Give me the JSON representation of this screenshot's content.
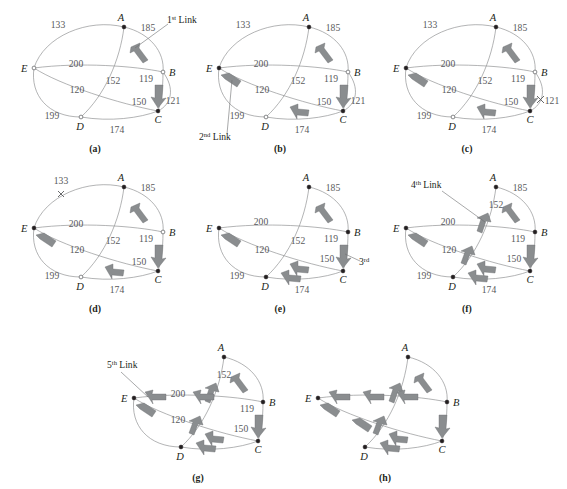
{
  "figure": {
    "nodes": [
      "A",
      "B",
      "C",
      "D",
      "E"
    ],
    "edge_weights": {
      "A_E": 133,
      "A_B": 185,
      "E_B": 200,
      "A_C": 152,
      "B_C": 119,
      "E_C": 120,
      "B_C_outer": 121,
      "D_C_inner": 150,
      "E_D": 199,
      "D_C": 174
    },
    "colors": {
      "edge": "#8a8b8d",
      "arrow_fill": "#8a8d8f",
      "arrow_stroke": "#6b6d70",
      "number": "#58595b",
      "label": "#231f20",
      "background": "#ffffff"
    }
  },
  "panels": [
    {
      "id": "a",
      "caption": "(a)",
      "annotation": "1st Link",
      "annotation_sup": "st",
      "annotation_base": "1",
      "annotation_rest": " Link",
      "nodes": [
        {
          "name": "A",
          "label": "A",
          "filled": true
        },
        {
          "name": "B",
          "label": "B",
          "filled": false
        },
        {
          "name": "C",
          "label": "C",
          "filled": true
        },
        {
          "name": "D",
          "label": "D",
          "filled": false
        },
        {
          "name": "E",
          "label": "E",
          "filled": false
        }
      ],
      "numbers": [
        "133",
        "185",
        "200",
        "152",
        "119",
        "120",
        "150",
        "121",
        "199",
        "174"
      ],
      "selected_links": [
        "A-B (185)",
        "B-C (119)"
      ]
    },
    {
      "id": "b",
      "caption": "(b)",
      "annotation": "2nd Link",
      "annotation_base": "2",
      "annotation_sup": "nd",
      "annotation_rest": " Link",
      "nodes": [
        {
          "name": "A",
          "label": "A",
          "filled": true
        },
        {
          "name": "B",
          "label": "B",
          "filled": false
        },
        {
          "name": "C",
          "label": "C",
          "filled": true
        },
        {
          "name": "D",
          "label": "D",
          "filled": false
        },
        {
          "name": "E",
          "label": "E",
          "filled": true
        }
      ],
      "numbers": [
        "133",
        "185",
        "200",
        "152",
        "119",
        "120",
        "150",
        "121",
        "199",
        "174"
      ],
      "selected_links": [
        "A-B (185)",
        "B-C (119)",
        "D-E (120)"
      ]
    },
    {
      "id": "c",
      "caption": "(c)",
      "annotation": "",
      "nodes": [
        {
          "name": "A",
          "label": "A",
          "filled": true
        },
        {
          "name": "B",
          "label": "B",
          "filled": false
        },
        {
          "name": "C",
          "label": "C",
          "filled": true
        },
        {
          "name": "D",
          "label": "D",
          "filled": false
        },
        {
          "name": "E",
          "label": "E",
          "filled": true
        }
      ],
      "numbers": [
        "133",
        "185",
        "200",
        "152",
        "119",
        "120",
        "150",
        "121",
        "199",
        "174"
      ],
      "rejected": "121"
    },
    {
      "id": "d",
      "caption": "(d)",
      "annotation": "",
      "nodes": [
        {
          "name": "A",
          "label": "A",
          "filled": true
        },
        {
          "name": "B",
          "label": "B",
          "filled": false
        },
        {
          "name": "C",
          "label": "C",
          "filled": true
        },
        {
          "name": "D",
          "label": "D",
          "filled": false
        },
        {
          "name": "E",
          "label": "E",
          "filled": true
        }
      ],
      "numbers": [
        "133",
        "185",
        "200",
        "152",
        "119",
        "120",
        "150",
        "199",
        "174"
      ],
      "rejected": "133"
    },
    {
      "id": "e",
      "caption": "(e)",
      "annotation": "3rd Link",
      "annotation_base": "3",
      "annotation_sup": "rd",
      "annotation_rest": "",
      "nodes": [
        {
          "name": "A",
          "label": "A",
          "filled": true
        },
        {
          "name": "B",
          "label": "B",
          "filled": true
        },
        {
          "name": "C",
          "label": "C",
          "filled": true
        },
        {
          "name": "D",
          "label": "D",
          "filled": true
        },
        {
          "name": "E",
          "label": "E",
          "filled": true
        }
      ],
      "numbers": [
        "185",
        "200",
        "152",
        "119",
        "120",
        "150",
        "199",
        "174"
      ],
      "selected_links": [
        "A-B (185)",
        "B-C (119)",
        "D-E (120)",
        "C-D (150)"
      ]
    },
    {
      "id": "f",
      "caption": "(f)",
      "annotation": "4th Link",
      "annotation_base": "4",
      "annotation_sup": "th",
      "annotation_rest": " Link",
      "nodes": [
        {
          "name": "A",
          "label": "A",
          "filled": true
        },
        {
          "name": "B",
          "label": "B",
          "filled": true
        },
        {
          "name": "C",
          "label": "C",
          "filled": true
        },
        {
          "name": "D",
          "label": "D",
          "filled": true
        },
        {
          "name": "E",
          "label": "E",
          "filled": true
        }
      ],
      "numbers": [
        "185",
        "152",
        "200",
        "119",
        "120",
        "150",
        "199",
        "174"
      ],
      "selected_links": [
        "A-B (185)",
        "B-C (119)",
        "D-E (120)",
        "C-D (150)",
        "A-D (152)"
      ]
    },
    {
      "id": "g",
      "caption": "(g)",
      "annotation": "5th Link",
      "annotation_base": "5",
      "annotation_sup": "th",
      "annotation_rest": " Link",
      "nodes": [
        {
          "name": "A",
          "label": "A",
          "filled": true
        },
        {
          "name": "B",
          "label": "B",
          "filled": true
        },
        {
          "name": "C",
          "label": "C",
          "filled": true
        },
        {
          "name": "D",
          "label": "D",
          "filled": true
        },
        {
          "name": "E",
          "label": "E",
          "filled": true
        }
      ],
      "numbers": [
        "152",
        "200",
        "119",
        "120",
        "150"
      ],
      "selected_links": [
        "A-B (185)",
        "B-C (119)",
        "D-E (120)",
        "C-D (150)",
        "A-D (152)",
        "B-E (200)"
      ]
    },
    {
      "id": "h",
      "caption": "(h)",
      "annotation": "",
      "nodes": [
        {
          "name": "A",
          "label": "A",
          "filled": true
        },
        {
          "name": "B",
          "label": "B",
          "filled": true
        },
        {
          "name": "C",
          "label": "C",
          "filled": true
        },
        {
          "name": "D",
          "label": "D",
          "filled": true
        },
        {
          "name": "E",
          "label": "E",
          "filled": true
        }
      ],
      "numbers": [],
      "selected_links": [
        "complete tour"
      ]
    }
  ],
  "labels": {
    "A": "A",
    "B": "B",
    "C": "C",
    "D": "D",
    "E": "E",
    "n133": "133",
    "n185": "185",
    "n200": "200",
    "n152": "152",
    "n119": "119",
    "n120": "120",
    "n150": "150",
    "n121": "121",
    "n199": "199",
    "n174": "174",
    "cap_a": "(a)",
    "cap_b": "(b)",
    "cap_c": "(c)",
    "cap_d": "(d)",
    "cap_e": "(e)",
    "cap_f": "(f)",
    "cap_g": "(g)",
    "cap_h": "(h)",
    "link1_base": "1",
    "link1_sup": "st",
    "link1_rest": " Link",
    "link2_base": "2",
    "link2_sup": "nd",
    "link2_rest": " Link",
    "link3_base": "3",
    "link3_sup": "rd",
    "link3_rest": "",
    "link4_base": "4",
    "link4_sup": "th",
    "link4_rest": " Link",
    "link5_base": "5",
    "link5_sup": "th",
    "link5_rest": " Link"
  }
}
